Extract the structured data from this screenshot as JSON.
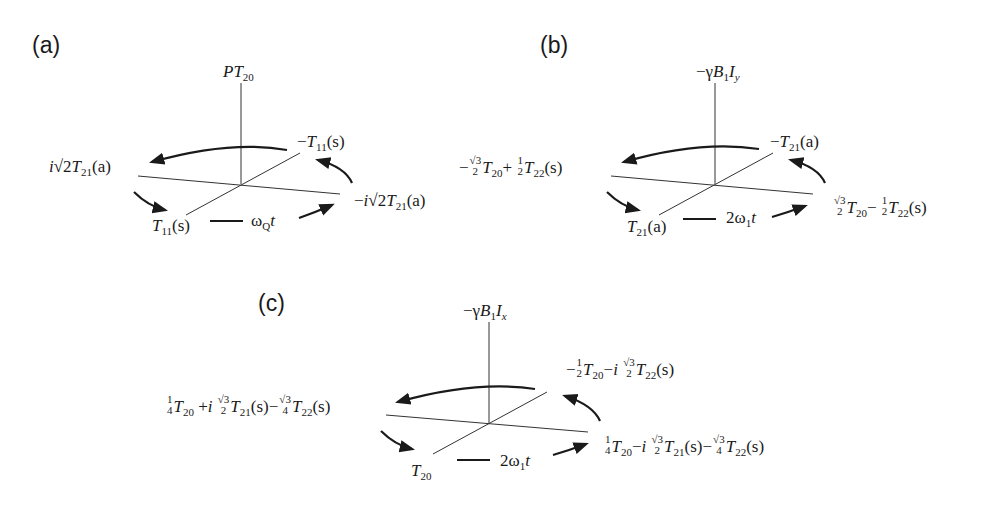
{
  "panels": [
    {
      "id": "a",
      "label": "(a)",
      "axis_top": "PT20",
      "top_right": "−T11(s)",
      "left": "i√2T21(a)",
      "right": "−i√2T21(a)",
      "bottom": "T11(s)",
      "rotation": "ωQt"
    },
    {
      "id": "b",
      "label": "(b)",
      "axis_top": "−γB1Iy",
      "top_right": "−T21(a)",
      "left": "−(√3/2)T20 + (1/2)T22(s)",
      "right": "(√3/2)T20 − (1/2)T22(s)",
      "bottom": "T21(a)",
      "rotation": "2ω1t"
    },
    {
      "id": "c",
      "label": "(c)",
      "axis_top": "−γB1Ix",
      "top_right": "−(1/2)T20 − i(√3/2)T22(s)",
      "left": "(1/4)T20 + i(√3/2)T21(s) − (√3/4)T22(s)",
      "right": "(1/4)T20 − i(√3/2)T21(s) − (√3/4)T22(s)",
      "bottom": "T20",
      "rotation": "2ω1t"
    }
  ],
  "text": {
    "a_label": "(a)",
    "b_label": "(b)",
    "c_label": "(c)",
    "sqrt3": "√3",
    "one": "1",
    "two": "2",
    "four": "4",
    "minus": "−",
    "plus": "+",
    "i": "i",
    "s": "(s)",
    "a": "(a)",
    "T": "T",
    "P": "P",
    "gamma": "−γ",
    "B": "B",
    "I": "I",
    "n20": "20",
    "n21": "21",
    "n22": "22",
    "n11": "11",
    "n1": "1",
    "y": "y",
    "x": "x",
    "sqrt2": "√2",
    "omega": "ω",
    "Q": "Q",
    "t": "t",
    "two_omega": "2ω"
  }
}
